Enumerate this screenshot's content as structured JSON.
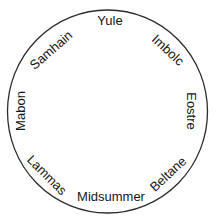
{
  "diagram": {
    "name": "Wheel of the Year",
    "type": "circular-calendar",
    "colors": {
      "background": "#ffffff",
      "circle_stroke": "#2b2b2b",
      "label_text": "#161616"
    },
    "labels": [
      {
        "text": "Yule",
        "position": "top",
        "wheel_angle_deg": 0
      },
      {
        "text": "Imbolc",
        "position": "upper-right",
        "wheel_angle_deg": 45
      },
      {
        "text": "Eostre",
        "position": "right",
        "wheel_angle_deg": 90
      },
      {
        "text": "Beltane",
        "position": "lower-right",
        "wheel_angle_deg": 135
      },
      {
        "text": "Midsummer",
        "position": "bottom",
        "wheel_angle_deg": 180
      },
      {
        "text": "Lammas",
        "position": "lower-left",
        "wheel_angle_deg": 225
      },
      {
        "text": "Mabon",
        "position": "left",
        "wheel_angle_deg": 270
      },
      {
        "text": "Samhain",
        "position": "upper-left",
        "wheel_angle_deg": 315
      }
    ]
  }
}
